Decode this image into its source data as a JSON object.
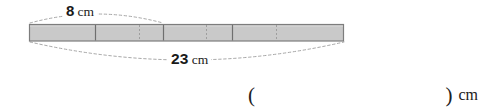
{
  "figure": {
    "type": "segmented-bar-diagram",
    "bar": {
      "fill_color": "#c9c9c9",
      "border_color": "#7d7d7d",
      "left_px": 29,
      "right_px": 344,
      "top_px": 24,
      "bottom_px": 41,
      "total_length_cm": 23,
      "solid_divider_px": [
        95,
        163,
        232
      ],
      "dotted_divider_px": [
        139,
        206,
        276
      ],
      "dotted_divider_color": "#9a9a9a"
    },
    "measure_top": {
      "value": "8",
      "unit": "cm",
      "span_from_px": 30,
      "span_to_px": 163,
      "arc_color": "#a6a6a6"
    },
    "measure_bottom": {
      "value": "23",
      "unit": "cm",
      "span_from_px": 30,
      "span_to_px": 344,
      "arc_color": "#a6a6a6"
    }
  },
  "answer": {
    "open_paren": "(",
    "close_paren": ")",
    "value": "",
    "placeholder": "",
    "unit": "cm"
  }
}
